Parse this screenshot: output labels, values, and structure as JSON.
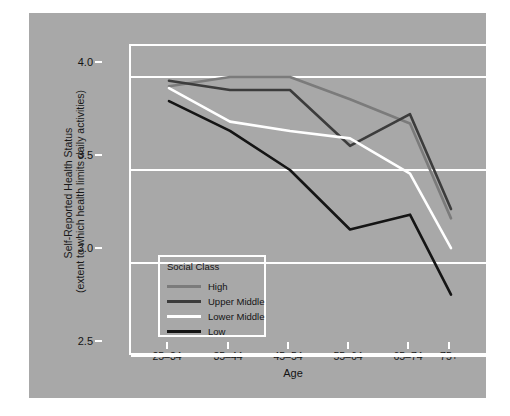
{
  "chart_data": {
    "type": "line",
    "title": "",
    "xlabel": "Age",
    "ylabel_line1": "Self-Reported Health Status",
    "ylabel_line2": "(extent to which health limits daily activities)",
    "categories": [
      "25–34",
      "35–44",
      "45–54",
      "55–64",
      "65–74",
      "75+"
    ],
    "ylim": [
      2.5,
      4.15
    ],
    "yticks": [
      "4.0",
      "3.5",
      "3.0",
      "2.5"
    ],
    "ytick_values": [
      4.0,
      3.5,
      3.0,
      2.5
    ],
    "grid": true,
    "grid_color": "#ffffff",
    "legend_position": "lower-left-inside",
    "legend_title": "Social Class",
    "series": [
      {
        "name": "High",
        "color": "#7b7b7b",
        "values": [
          3.95,
          4.0,
          4.0,
          3.88,
          3.75,
          3.24
        ]
      },
      {
        "name": "Upper Middle",
        "color": "#3c3c3c",
        "values": [
          3.98,
          3.93,
          3.93,
          3.63,
          3.8,
          3.29
        ]
      },
      {
        "name": "Lower Middle",
        "color": "#ffffff",
        "values": [
          3.94,
          3.76,
          3.71,
          3.67,
          3.48,
          3.08
        ]
      },
      {
        "name": "Low",
        "color": "#151515",
        "values": [
          3.87,
          3.71,
          3.5,
          3.18,
          3.26,
          2.83
        ]
      }
    ],
    "background_color": "#a8a8a8",
    "page_color": "#ffffff"
  }
}
